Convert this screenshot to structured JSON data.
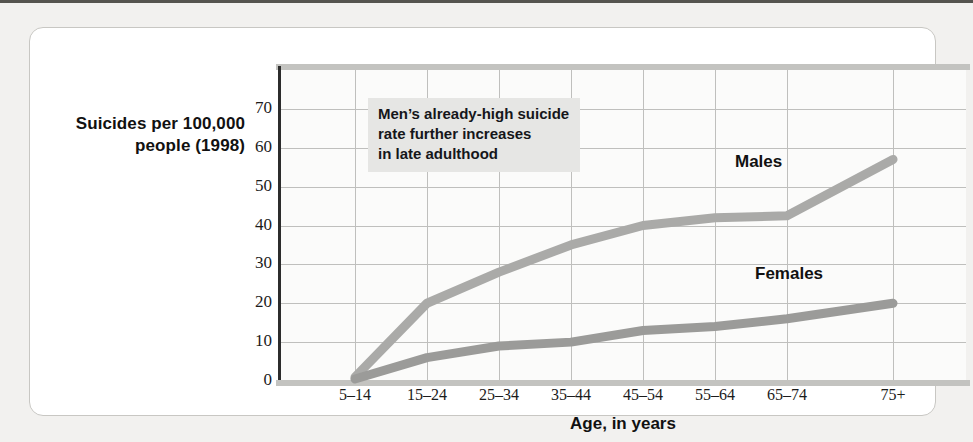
{
  "figure": {
    "y_axis_title": "Suicides per\n100,000 people\n(1998)",
    "x_axis_title": "Age, in years",
    "annotation": "Men’s already-high suicide\nrate further increases\nin late adulthood"
  },
  "chart_data": {
    "type": "line",
    "title": "",
    "xlabel": "Age, in years",
    "ylabel": "Suicides per 100,000 people (1998)",
    "categories": [
      "5–14",
      "15–24",
      "25–34",
      "35–44",
      "45–54",
      "55–64",
      "65–74",
      "75+"
    ],
    "yticks": [
      0,
      10,
      20,
      30,
      40,
      50,
      60,
      70
    ],
    "ylim": [
      0,
      80
    ],
    "grid": true,
    "legend": "inline-labels",
    "series": [
      {
        "name": "Males",
        "color": "#aaaaa8",
        "values": [
          1,
          20,
          28,
          35,
          40,
          42,
          42.5,
          57
        ]
      },
      {
        "name": "Females",
        "color": "#9b9b99",
        "values": [
          0.5,
          6,
          9,
          10,
          13,
          14,
          16,
          20
        ]
      }
    ],
    "annotations": [
      {
        "text": "Men’s already-high suicide rate further increases in late adulthood",
        "target_series": "Males"
      }
    ]
  },
  "colors": {
    "page_background": "#f2f1ef",
    "card_background": "#ffffff",
    "plot_background": "#fbfbfa",
    "gridline": "#bfbfbd",
    "axis": "#2c2c2c",
    "annotation_background": "#e6e6e4",
    "text": "#111111"
  }
}
